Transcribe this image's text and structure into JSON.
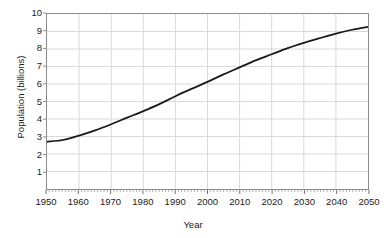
{
  "chart_data": {
    "type": "line",
    "title": "",
    "xlabel": "Year",
    "ylabel": "Population (billions)",
    "xlim": [
      1950,
      2050
    ],
    "ylim": [
      0,
      10
    ],
    "grid": true,
    "legend": false,
    "line_color": "#1a1a1a",
    "grid_color": "#d9d9d9",
    "axis_color": "#8c8c8c",
    "x_ticks": [
      1950,
      1960,
      1970,
      1980,
      1990,
      2000,
      2010,
      2020,
      2030,
      2040,
      2050
    ],
    "x_tick_labels": [
      "1950",
      "1960",
      "1970",
      "1980",
      "1990",
      "2000",
      "2010",
      "2020",
      "2030",
      "2040",
      "2050"
    ],
    "y_ticks": [
      1,
      2,
      3,
      4,
      5,
      6,
      7,
      8,
      9,
      10
    ],
    "y_tick_labels": [
      "1",
      "2",
      "3",
      "4",
      "5",
      "6",
      "7",
      "8",
      "9",
      "10"
    ],
    "x": [
      1950,
      1955,
      1960,
      1965,
      1970,
      1975,
      1980,
      1985,
      1990,
      1995,
      2000,
      2005,
      2010,
      2015,
      2020,
      2025,
      2030,
      2035,
      2040,
      2045,
      2050
    ],
    "values": [
      2.7,
      2.8,
      3.05,
      3.35,
      3.7,
      4.08,
      4.45,
      4.85,
      5.3,
      5.72,
      6.12,
      6.55,
      6.95,
      7.35,
      7.7,
      8.05,
      8.35,
      8.62,
      8.88,
      9.1,
      9.27
    ],
    "series": [
      {
        "name": "World population",
        "values": [
          2.7,
          2.8,
          3.05,
          3.35,
          3.7,
          4.08,
          4.45,
          4.85,
          5.3,
          5.72,
          6.12,
          6.55,
          6.95,
          7.35,
          7.7,
          8.05,
          8.35,
          8.62,
          8.88,
          9.1,
          9.27
        ]
      }
    ]
  }
}
